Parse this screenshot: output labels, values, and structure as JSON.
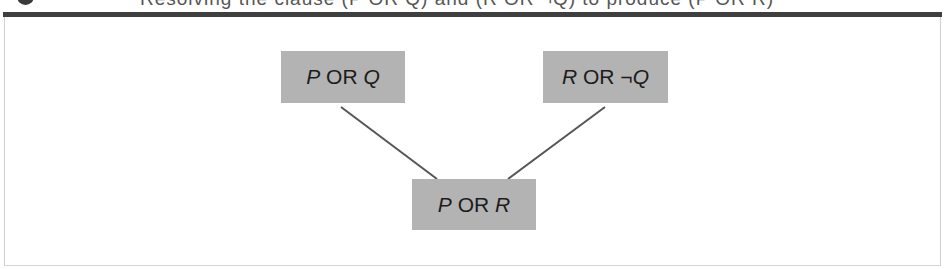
{
  "caption": {
    "bullet_icon": "circle-bullet-icon",
    "text": "Resolving the clause (P OR Q) and (R OR ¬Q) to produce (P OR R)"
  },
  "diagram": {
    "type": "resolution-tree",
    "nodes": [
      {
        "id": "premise-1",
        "var1": "P",
        "op": " OR ",
        "var2": "Q",
        "neg": ""
      },
      {
        "id": "premise-2",
        "var1": "R",
        "op": " OR ",
        "var2": "Q",
        "neg": "¬"
      },
      {
        "id": "resolvent",
        "var1": "P",
        "op": " OR ",
        "var2": "R",
        "neg": ""
      }
    ],
    "edges": [
      {
        "from": "premise-1",
        "to": "resolvent"
      },
      {
        "from": "premise-2",
        "to": "resolvent"
      }
    ],
    "colors": {
      "node_fill": "#b3b3b3",
      "edge": "#555555",
      "top_bar": "#3f3f3f"
    }
  }
}
